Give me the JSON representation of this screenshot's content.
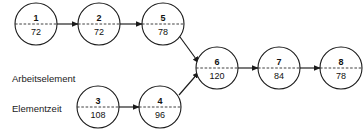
{
  "diagram": {
    "type": "precedence-network",
    "background_color": "#ffffff",
    "line_color": "#1a1a1a",
    "text_color": "#111111",
    "annotations": [
      {
        "id": "arbeitselement",
        "label": "Arbeitselement",
        "x": 12,
        "y": 82
      },
      {
        "id": "elementzeit",
        "label": "Elementzeit",
        "x": 12,
        "y": 112
      }
    ],
    "nodes": [
      {
        "id": "node-1",
        "number": "1",
        "time": "72",
        "cx": 36,
        "cy": 24,
        "r": 21
      },
      {
        "id": "node-2",
        "number": "2",
        "time": "72",
        "cx": 99,
        "cy": 24,
        "r": 21
      },
      {
        "id": "node-5",
        "number": "5",
        "time": "78",
        "cx": 163,
        "cy": 24,
        "r": 21
      },
      {
        "id": "node-3",
        "number": "3",
        "time": "108",
        "cx": 98,
        "cy": 107,
        "r": 21
      },
      {
        "id": "node-4",
        "number": "4",
        "time": "96",
        "cx": 160,
        "cy": 107,
        "r": 21
      },
      {
        "id": "node-6",
        "number": "6",
        "time": "120",
        "cx": 217,
        "cy": 68,
        "r": 21
      },
      {
        "id": "node-7",
        "number": "7",
        "time": "84",
        "cx": 279,
        "cy": 68,
        "r": 21
      },
      {
        "id": "node-8",
        "number": "8",
        "time": "78",
        "cx": 341,
        "cy": 68,
        "r": 21
      }
    ],
    "edges": [
      {
        "id": "edge-1-2",
        "from": "node-1",
        "to": "node-2",
        "x1": 57,
        "y1": 24,
        "x2": 78,
        "y2": 24
      },
      {
        "id": "edge-2-5",
        "from": "node-2",
        "to": "node-5",
        "x1": 120,
        "y1": 24,
        "x2": 142,
        "y2": 24
      },
      {
        "id": "edge-5-6",
        "from": "node-5",
        "to": "node-6",
        "x1": 180,
        "y1": 37,
        "x2": 199,
        "y2": 63
      },
      {
        "id": "edge-3-4",
        "from": "node-3",
        "to": "node-4",
        "x1": 119,
        "y1": 107,
        "x2": 139,
        "y2": 107
      },
      {
        "id": "edge-4-6",
        "from": "node-4",
        "to": "node-6",
        "x1": 179,
        "y1": 95,
        "x2": 199,
        "y2": 72
      },
      {
        "id": "edge-6-7",
        "from": "node-6",
        "to": "node-7",
        "x1": 238,
        "y1": 68,
        "x2": 258,
        "y2": 68
      },
      {
        "id": "edge-7-8",
        "from": "node-7",
        "to": "node-8",
        "x1": 300,
        "y1": 68,
        "x2": 320,
        "y2": 68
      }
    ]
  }
}
